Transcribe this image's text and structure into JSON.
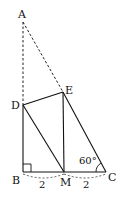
{
  "diagram": {
    "points": {
      "A": {
        "label": "A"
      },
      "B": {
        "label": "B"
      },
      "C": {
        "label": "C"
      },
      "D": {
        "label": "D"
      },
      "E": {
        "label": "E"
      },
      "M": {
        "label": "M"
      }
    },
    "lengths": {
      "BM": "2",
      "MC": "2"
    },
    "angle_C": "60°",
    "right_angle_at": "B"
  }
}
